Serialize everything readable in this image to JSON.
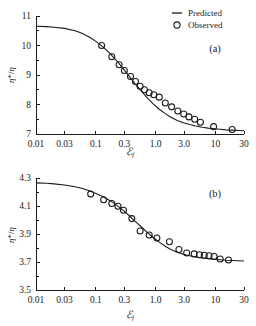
{
  "figure": {
    "legend": {
      "predicted_label": "Predicted",
      "observed_label": "Observed",
      "predicted_icon": "line-swatch-icon",
      "observed_icon": "circle-marker-icon"
    },
    "panels": [
      {
        "tag": "(a)"
      },
      {
        "tag": "(b)"
      }
    ]
  },
  "chart_data": [
    {
      "type": "line",
      "panel": "(a)",
      "title": "",
      "xlabel": "ℰf",
      "ylabel": "η*/η",
      "xscale": "log",
      "xlim": [
        0.01,
        30
      ],
      "ylim": [
        7,
        11
      ],
      "xticks": [
        0.01,
        0.03,
        0.1,
        0.3,
        1.0,
        3.0,
        10,
        30
      ],
      "xticklabels": [
        "0.01",
        "0.03",
        "0.1",
        "0.3",
        "1.0",
        "3.0",
        "10",
        "30"
      ],
      "yticks": [
        7,
        8,
        9,
        10,
        11
      ],
      "yticklabels": [
        "7",
        "8",
        "9",
        "10",
        "11"
      ],
      "grid": false,
      "legend_position": "top-right",
      "series": [
        {
          "name": "Predicted",
          "style": "line",
          "x": [
            0.01,
            0.015,
            0.02,
            0.03,
            0.045,
            0.06,
            0.08,
            0.1,
            0.13,
            0.17,
            0.22,
            0.28,
            0.36,
            0.45,
            0.58,
            0.72,
            0.9,
            1.15,
            1.45,
            1.8,
            2.3,
            2.9,
            3.7,
            4.7,
            6.0,
            7.5,
            9.5,
            12,
            15,
            19,
            24,
            30
          ],
          "y": [
            10.65,
            10.64,
            10.62,
            10.58,
            10.5,
            10.41,
            10.27,
            10.14,
            9.96,
            9.74,
            9.5,
            9.24,
            8.96,
            8.71,
            8.45,
            8.23,
            8.03,
            7.84,
            7.69,
            7.57,
            7.46,
            7.38,
            7.32,
            7.27,
            7.23,
            7.2,
            7.18,
            7.16,
            7.14,
            7.13,
            7.12,
            7.11
          ]
        },
        {
          "name": "Observed",
          "style": "markers",
          "x": [
            0.125,
            0.185,
            0.245,
            0.3,
            0.38,
            0.46,
            0.55,
            0.65,
            0.78,
            0.93,
            1.15,
            1.45,
            1.85,
            2.35,
            2.95,
            3.6,
            4.5,
            5.6,
            9.3,
            19.0
          ],
          "y": [
            10.0,
            9.62,
            9.35,
            9.15,
            8.95,
            8.78,
            8.62,
            8.5,
            8.4,
            8.33,
            8.25,
            8.05,
            7.92,
            7.78,
            7.68,
            7.58,
            7.5,
            7.4,
            7.25,
            7.15
          ]
        }
      ]
    },
    {
      "type": "line",
      "panel": "(b)",
      "title": "",
      "xlabel": "ℰf",
      "ylabel": "η*/η",
      "xscale": "log",
      "xlim": [
        0.01,
        30
      ],
      "ylim": [
        3.5,
        4.3
      ],
      "xticks": [
        0.01,
        0.03,
        0.1,
        0.3,
        1.0,
        3.0,
        10,
        30
      ],
      "xticklabels": [
        "0.01",
        "0.03",
        "0.1",
        "0.3",
        "1.0",
        "3.0",
        "10",
        "30"
      ],
      "yticks": [
        3.5,
        3.7,
        3.9,
        4.1,
        4.3
      ],
      "yticklabels": [
        "3.5",
        "3.7",
        "3.9",
        "4.1",
        "4.3"
      ],
      "grid": false,
      "legend_position": "none",
      "series": [
        {
          "name": "Predicted",
          "style": "line",
          "x": [
            0.01,
            0.015,
            0.02,
            0.03,
            0.045,
            0.06,
            0.08,
            0.1,
            0.13,
            0.17,
            0.22,
            0.28,
            0.36,
            0.45,
            0.58,
            0.72,
            0.9,
            1.15,
            1.45,
            1.8,
            2.3,
            2.9,
            3.7,
            4.7,
            6.0,
            7.5,
            9.5,
            12,
            15,
            19,
            24,
            30
          ],
          "y": [
            4.265,
            4.262,
            4.258,
            4.25,
            4.238,
            4.225,
            4.207,
            4.19,
            4.168,
            4.14,
            4.108,
            4.072,
            4.032,
            3.992,
            3.95,
            3.912,
            3.877,
            3.842,
            3.812,
            3.79,
            3.77,
            3.756,
            3.745,
            3.736,
            3.729,
            3.724,
            3.72,
            3.716,
            3.713,
            3.711,
            3.709,
            3.707
          ]
        },
        {
          "name": "Observed",
          "style": "markers",
          "x": [
            0.082,
            0.135,
            0.185,
            0.235,
            0.29,
            0.4,
            0.55,
            0.78,
            1.05,
            1.7,
            2.45,
            3.3,
            4.4,
            5.4,
            6.5,
            7.8,
            9.5,
            12.0,
            16.5
          ],
          "y": [
            4.185,
            4.145,
            4.118,
            4.098,
            4.07,
            4.01,
            3.922,
            3.893,
            3.872,
            3.845,
            3.79,
            3.765,
            3.758,
            3.752,
            3.748,
            3.745,
            3.74,
            3.722,
            3.715
          ]
        }
      ]
    }
  ]
}
